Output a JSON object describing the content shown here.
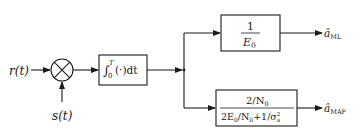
{
  "diagram": {
    "type": "block-diagram",
    "inputs": {
      "received_signal": "r(t)",
      "reference_signal": "s(t)"
    },
    "multiplier": {
      "symbol": "×"
    },
    "integrator": {
      "integral_sign": "∫",
      "lower_limit": "0",
      "upper_limit": "T",
      "body": "(·)dt"
    },
    "ml_branch": {
      "numerator": "1",
      "denominator_base": "E",
      "denominator_sub": "0",
      "output_base": "â",
      "output_sub": "ML"
    },
    "map_branch": {
      "numerator": "2/N",
      "numerator_sub": "0",
      "den_part1": "2E",
      "den_sub1": "0",
      "den_part2": "/N",
      "den_sub2": "0",
      "den_part3": "+1/σ",
      "den_sup3": "2",
      "den_sub3": "a",
      "output_base": "â",
      "output_sub": "MAP"
    }
  }
}
